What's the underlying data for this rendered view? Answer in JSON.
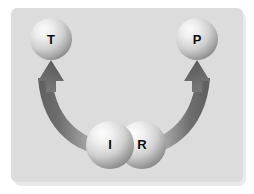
{
  "figure": {
    "kind": "process-diagram",
    "panel": {
      "background_color": "#dcdcdc",
      "page_color": "#ffffff",
      "corner_radius": 6,
      "x": 11,
      "y": 8,
      "width": 232,
      "height": 174
    },
    "nodes": [
      {
        "id": "T",
        "label": "T",
        "role": "target-sphere",
        "shape": "sphere",
        "cx": 51,
        "cy": 39,
        "r": 21,
        "fill_light": "#f2f2f2",
        "fill_dark": "#8e8e8e"
      },
      {
        "id": "P",
        "label": "P",
        "role": "product-sphere",
        "shape": "sphere",
        "cx": 197,
        "cy": 39,
        "r": 21,
        "fill_light": "#f2f2f2",
        "fill_dark": "#8e8e8e"
      },
      {
        "id": "I",
        "label": "I",
        "role": "source-sphere-left",
        "shape": "sphere",
        "cx": 110,
        "cy": 145,
        "r": 24,
        "fill_light": "#f4f4f4",
        "fill_dark": "#8a8a8a"
      },
      {
        "id": "R",
        "label": "R",
        "role": "source-sphere-right",
        "shape": "sphere",
        "cx": 142,
        "cy": 145,
        "r": 24,
        "fill_light": "#f4f4f4",
        "fill_dark": "#8a8a8a"
      }
    ],
    "arrows": [
      {
        "id": "arrow-to-T",
        "from": "IR",
        "to": "T",
        "direction": "up-left",
        "head_x": 51,
        "head_y": 62,
        "color_dark": "#6a6a6a",
        "color_light": "#d2d2d2"
      },
      {
        "id": "arrow-to-P",
        "from": "IR",
        "to": "P",
        "direction": "up-right",
        "head_x": 197,
        "head_y": 62,
        "color_dark": "#6a6a6a",
        "color_light": "#d2d2d2"
      }
    ],
    "colors": {
      "label_text": "#0d0d0d",
      "panel_bg": "#dcdcdc",
      "band_dark": "#6a6a6a",
      "band_light": "#e2e2e2"
    }
  }
}
